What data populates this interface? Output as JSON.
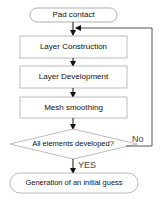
{
  "diagram": {
    "type": "flowchart",
    "nodes": {
      "start": {
        "label": "Pad contact",
        "shape": "rounded"
      },
      "step1": {
        "label": "Layer Construction",
        "shape": "rect"
      },
      "step2": {
        "label": "Layer Development",
        "shape": "rect"
      },
      "step3": {
        "label": "Mesh smoothing",
        "shape": "rect"
      },
      "decision": {
        "label": "All elements developed?",
        "shape": "diamond"
      },
      "end": {
        "label": "Generation of an initial guess",
        "shape": "rounded"
      }
    },
    "edges": {
      "no_label": "No",
      "yes_label": "YES"
    },
    "colors": {
      "stroke": "#888888",
      "arrow": "#111111",
      "text": "#111111"
    }
  }
}
